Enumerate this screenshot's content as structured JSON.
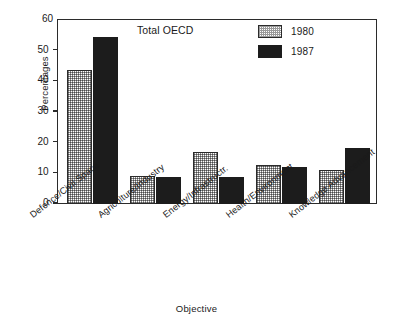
{
  "chart_data": {
    "type": "bar",
    "title": "Total OECD",
    "xlabel": "Objective",
    "ylabel": "Percentages",
    "ylim": [
      0,
      60
    ],
    "yticks": [
      0,
      10,
      20,
      30,
      40,
      50,
      60
    ],
    "ytick_labels": [
      "0",
      "10",
      "20",
      "30",
      "40",
      "50",
      "60"
    ],
    "grid": false,
    "legend_position": "top-right-inside",
    "categories": [
      "Defence/Civil Space",
      "Agriculture/Industry",
      "Energy/Infrastructr.",
      "Health/Environment",
      "Knowledge Advancement"
    ],
    "series": [
      {
        "name": "1980",
        "fill": "stipple-light",
        "color": "#d9d9d9",
        "values": [
          43.5,
          9.0,
          17.0,
          12.8,
          11.0
        ]
      },
      {
        "name": "1987",
        "fill": "solid-black",
        "color": "#1c1c1c",
        "values": [
          54.2,
          8.8,
          8.7,
          12.0,
          18.2
        ]
      }
    ]
  },
  "colors": {
    "axis": "#2b2b2b",
    "series_1980": "#d9d9d9",
    "series_1987": "#1c1c1c",
    "background": "#ffffff"
  }
}
